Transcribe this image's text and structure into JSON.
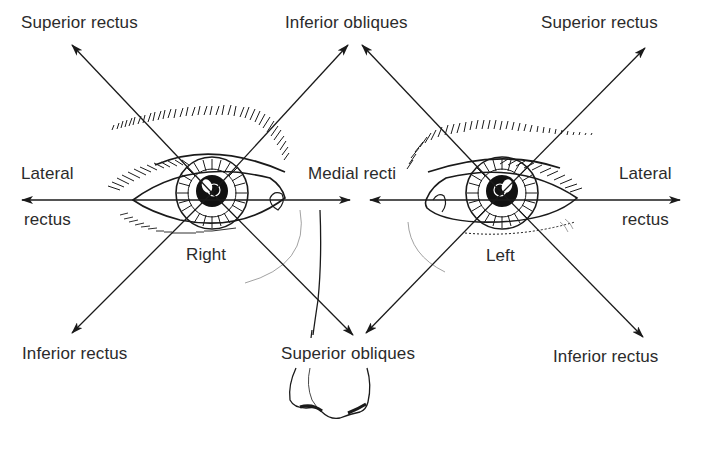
{
  "diagram": {
    "type": "extraocular-muscle-actions",
    "colors": {
      "ink": "#1a1a1a",
      "text": "#2b2b2b",
      "faint": "#8a8a8a",
      "background": "#ffffff"
    },
    "labels": {
      "right_superior_rectus": "Superior rectus",
      "right_inferior_obliques": "Inferior obliques",
      "left_superior_rectus": "Superior rectus",
      "right_lateral_1": "Lateral",
      "right_lateral_2": "rectus",
      "medial_recti": "Medial recti",
      "left_lateral_1": "Lateral",
      "left_lateral_2": "rectus",
      "right_eye": "Right",
      "left_eye": "Left",
      "right_inferior_rectus": "Inferior rectus",
      "superior_obliques": "Superior obliques",
      "left_inferior_rectus": "Inferior rectus"
    },
    "eyes": [
      {
        "side": "Right",
        "center": [
          212,
          193
        ]
      },
      {
        "side": "Left",
        "center": [
          502,
          193
        ]
      }
    ],
    "arrows": [
      {
        "muscle": "Superior rectus",
        "eye": "Right",
        "from": [
          212,
          193
        ],
        "to": [
          72,
          45
        ]
      },
      {
        "muscle": "Inferior obliques",
        "eye": "Right",
        "from": [
          212,
          193
        ],
        "to": [
          348,
          45
        ]
      },
      {
        "muscle": "Lateral rectus",
        "eye": "Right",
        "from": [
          212,
          200
        ],
        "to": [
          22,
          200
        ]
      },
      {
        "muscle": "Medial rectus",
        "eye": "Right",
        "from": [
          212,
          200
        ],
        "to": [
          350,
          200
        ]
      },
      {
        "muscle": "Inferior rectus",
        "eye": "Right",
        "from": [
          212,
          193
        ],
        "to": [
          72,
          333
        ]
      },
      {
        "muscle": "Superior obliques",
        "eye": "Right",
        "from": [
          212,
          193
        ],
        "to": [
          353,
          335
        ]
      },
      {
        "muscle": "Inferior obliques",
        "eye": "Left",
        "from": [
          502,
          193
        ],
        "to": [
          362,
          45
        ]
      },
      {
        "muscle": "Superior rectus",
        "eye": "Left",
        "from": [
          502,
          193
        ],
        "to": [
          645,
          48
        ]
      },
      {
        "muscle": "Medial rectus",
        "eye": "Left",
        "from": [
          502,
          200
        ],
        "to": [
          370,
          200
        ]
      },
      {
        "muscle": "Lateral rectus",
        "eye": "Left",
        "from": [
          502,
          200
        ],
        "to": [
          680,
          200
        ]
      },
      {
        "muscle": "Superior obliques",
        "eye": "Left",
        "from": [
          502,
          193
        ],
        "to": [
          366,
          333
        ]
      },
      {
        "muscle": "Inferior rectus",
        "eye": "Left",
        "from": [
          502,
          193
        ],
        "to": [
          643,
          337
        ]
      }
    ]
  }
}
